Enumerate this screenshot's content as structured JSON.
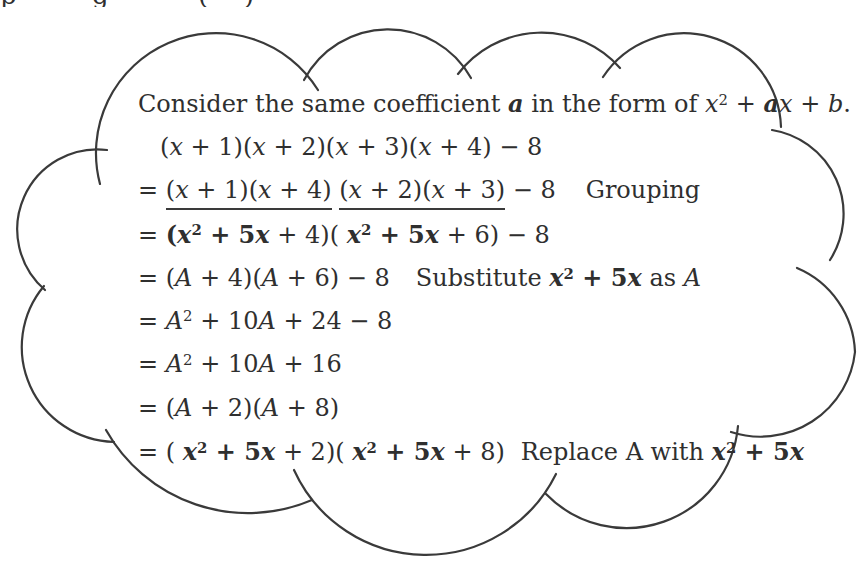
{
  "colors": {
    "ink": "#2f2f2f",
    "cloud_stroke": "#3a3a3a",
    "background": "#ffffff"
  },
  "cutoff_top_text": {
    "fragments": [
      {
        "glyph": "p",
        "x": 0
      },
      {
        "glyph": "g",
        "x": 92
      },
      {
        "glyph": "(",
        "x": 198
      },
      {
        "glyph": ")",
        "x": 244
      }
    ]
  },
  "content": {
    "lines": [
      {
        "segments": [
          {
            "t": "Consider the same coefficient ",
            "s": "rm"
          },
          {
            "t": "a",
            "s": "bi"
          },
          {
            "t": " in the form of ",
            "s": "rm"
          },
          {
            "t": "x",
            "s": "it"
          },
          {
            "t": "2",
            "s": "sup"
          },
          {
            "t": " + ",
            "s": "rm"
          },
          {
            "t": "a",
            "s": "bi"
          },
          {
            "t": "x",
            "s": "it"
          },
          {
            "t": " + ",
            "s": "rm"
          },
          {
            "t": "b",
            "s": "it"
          },
          {
            "t": ".",
            "s": "rm"
          }
        ]
      },
      {
        "segments": [
          {
            "t": "(",
            "s": "rm"
          },
          {
            "t": "x",
            "s": "it"
          },
          {
            "t": " + 1)(",
            "s": "rm"
          },
          {
            "t": "x",
            "s": "it"
          },
          {
            "t": " + 2)(",
            "s": "rm"
          },
          {
            "t": "x",
            "s": "it"
          },
          {
            "t": " + 3)(",
            "s": "rm"
          },
          {
            "t": "x",
            "s": "it"
          },
          {
            "t": " + 4) − 8",
            "s": "rm"
          }
        ]
      },
      {
        "segments": [
          {
            "t": "= ",
            "s": "rm"
          },
          {
            "t": "(",
            "s": "rm",
            "u": 1
          },
          {
            "t": "x",
            "s": "it",
            "u": 1
          },
          {
            "t": " + 1)(",
            "s": "rm",
            "u": 1
          },
          {
            "t": "x",
            "s": "it",
            "u": 1
          },
          {
            "t": " + 4)",
            "s": "rm",
            "u": 1
          },
          {
            "t": " ",
            "s": "rm"
          },
          {
            "t": "(",
            "s": "rm",
            "u": 1
          },
          {
            "t": "x",
            "s": "it",
            "u": 1
          },
          {
            "t": " + 2)(",
            "s": "rm",
            "u": 1
          },
          {
            "t": "x",
            "s": "it",
            "u": 1
          },
          {
            "t": " + 3)",
            "s": "rm",
            "u": 1
          },
          {
            "t": " − 8",
            "s": "rm"
          },
          {
            "gap": 30
          },
          {
            "t": "Grouping",
            "s": "rm"
          }
        ]
      },
      {
        "segments": [
          {
            "t": "= ",
            "s": "rm"
          },
          {
            "t": "(",
            "s": "b"
          },
          {
            "t": "x",
            "s": "bi"
          },
          {
            "t": "2",
            "s": "bsup"
          },
          {
            "t": " + 5",
            "s": "b"
          },
          {
            "t": "x",
            "s": "bi"
          },
          {
            "t": " + 4",
            "s": "rm"
          },
          {
            "t": ")( ",
            "s": "rm"
          },
          {
            "t": "x",
            "s": "bi"
          },
          {
            "t": "2",
            "s": "bsup"
          },
          {
            "t": " + 5",
            "s": "b"
          },
          {
            "t": "x",
            "s": "bi"
          },
          {
            "t": " + 6",
            "s": "rm"
          },
          {
            "t": ") − 8",
            "s": "rm"
          }
        ]
      },
      {
        "segments": [
          {
            "t": "= (",
            "s": "rm"
          },
          {
            "t": "A",
            "s": "it"
          },
          {
            "t": " + 4)(",
            "s": "rm"
          },
          {
            "t": "A",
            "s": "it"
          },
          {
            "t": " + 6) − 8",
            "s": "rm"
          },
          {
            "gap": 26
          },
          {
            "t": "Substitute ",
            "s": "rm"
          },
          {
            "t": "x",
            "s": "bi"
          },
          {
            "t": "2",
            "s": "bsup"
          },
          {
            "t": " + 5",
            "s": "b"
          },
          {
            "t": "x",
            "s": "bi"
          },
          {
            "t": " as ",
            "s": "rm"
          },
          {
            "t": "A",
            "s": "it"
          }
        ]
      },
      {
        "segments": [
          {
            "t": "= ",
            "s": "rm"
          },
          {
            "t": "A",
            "s": "it"
          },
          {
            "t": "2",
            "s": "sup"
          },
          {
            "t": " + 10",
            "s": "rm"
          },
          {
            "t": "A",
            "s": "it"
          },
          {
            "t": " + 24 − 8",
            "s": "rm"
          }
        ]
      },
      {
        "segments": [
          {
            "t": "= ",
            "s": "rm"
          },
          {
            "t": "A",
            "s": "it"
          },
          {
            "t": "2",
            "s": "sup"
          },
          {
            "t": " + 10",
            "s": "rm"
          },
          {
            "t": "A",
            "s": "it"
          },
          {
            "t": " + 16",
            "s": "rm"
          }
        ]
      },
      {
        "segments": [
          {
            "t": "= (",
            "s": "rm"
          },
          {
            "t": "A",
            "s": "it"
          },
          {
            "t": " + 2)(",
            "s": "rm"
          },
          {
            "t": "A",
            "s": "it"
          },
          {
            "t": " + 8)",
            "s": "rm"
          }
        ]
      },
      {
        "segments": [
          {
            "t": "= ( ",
            "s": "rm"
          },
          {
            "t": "x",
            "s": "bi"
          },
          {
            "t": "2",
            "s": "bsup"
          },
          {
            "t": " + 5",
            "s": "b"
          },
          {
            "t": "x",
            "s": "bi"
          },
          {
            "t": " + 2)( ",
            "s": "rm"
          },
          {
            "t": "x",
            "s": "bi"
          },
          {
            "t": "2",
            "s": "bsup"
          },
          {
            "t": " + 5",
            "s": "b"
          },
          {
            "t": "x",
            "s": "bi"
          },
          {
            "t": " + 8)",
            "s": "rm"
          },
          {
            "gap": 16
          },
          {
            "t": "Replace A with ",
            "s": "rm"
          },
          {
            "t": "x",
            "s": "bi"
          },
          {
            "t": "2",
            "s": "bsup"
          },
          {
            "t": " + 5",
            "s": "b"
          },
          {
            "t": "x",
            "s": "bi"
          }
        ]
      }
    ]
  }
}
